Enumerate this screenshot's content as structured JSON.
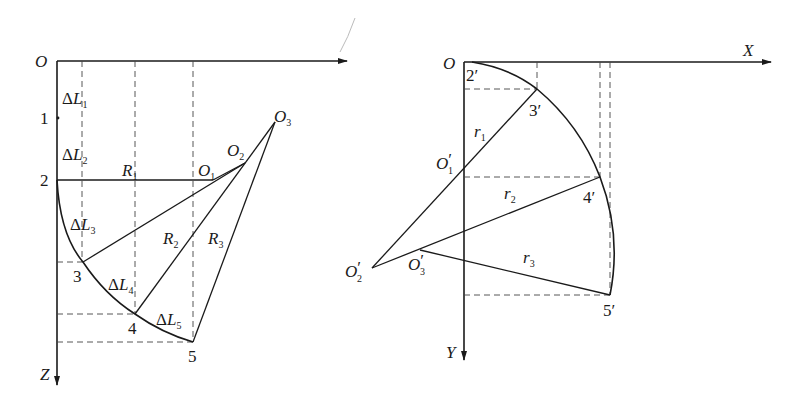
{
  "left_view": {
    "origin": "O",
    "axis_z": "Z",
    "points": [
      {
        "id": "1",
        "label": "1"
      },
      {
        "id": "2",
        "label": "2"
      },
      {
        "id": "3",
        "label": "3"
      },
      {
        "id": "4",
        "label": "4"
      },
      {
        "id": "5",
        "label": "5"
      }
    ],
    "centers": [
      {
        "base": "O",
        "sub": "1"
      },
      {
        "base": "O",
        "sub": "2"
      },
      {
        "base": "O",
        "sub": "3"
      }
    ],
    "radii": [
      {
        "base": "R",
        "sub": "1"
      },
      {
        "base": "R",
        "sub": "2"
      },
      {
        "base": "R",
        "sub": "3"
      }
    ],
    "segments": [
      {
        "delta": "Δ",
        "base": "L",
        "sub": "1"
      },
      {
        "delta": "Δ",
        "base": "L",
        "sub": "2"
      },
      {
        "delta": "Δ",
        "base": "L",
        "sub": "3"
      },
      {
        "delta": "Δ",
        "base": "L",
        "sub": "4"
      },
      {
        "delta": "Δ",
        "base": "L",
        "sub": "5"
      }
    ]
  },
  "right_view": {
    "origin": "O",
    "axis_x": "X",
    "axis_y": "Y",
    "points": [
      {
        "num": "2",
        "prime": "′"
      },
      {
        "num": "3",
        "prime": "′"
      },
      {
        "num": "4",
        "prime": "′"
      },
      {
        "num": "5",
        "prime": "′"
      }
    ],
    "centers": [
      {
        "base": "O",
        "prime": "′",
        "sub": "1"
      },
      {
        "base": "O",
        "prime": "′",
        "sub": "2"
      },
      {
        "base": "O",
        "prime": "′",
        "sub": "3"
      }
    ],
    "radii": [
      {
        "base": "r",
        "sub": "1"
      },
      {
        "base": "r",
        "sub": "2"
      },
      {
        "base": "r",
        "sub": "3"
      }
    ]
  }
}
